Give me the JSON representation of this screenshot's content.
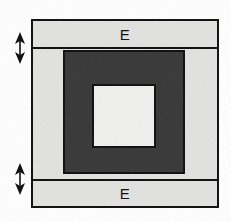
{
  "diagram": {
    "canvas": {
      "width": 231,
      "height": 222,
      "background": "#ffffff"
    },
    "colors": {
      "light_gray": "#e2e2e0",
      "dark_gray": "#3a3a3a",
      "cavity_white": "#f0f0ee",
      "outline": "#111111"
    },
    "layers": {
      "top_band": {
        "label": "E",
        "fill": "#e2e2e0",
        "x": 31,
        "y": 19,
        "width": 188,
        "height": 30
      },
      "bottom_band": {
        "label": "E",
        "fill": "#e2e2e0",
        "x": 31,
        "y": 179,
        "width": 188,
        "height": 29
      },
      "outer_frame": {
        "fill": "#e2e2e0",
        "x": 31,
        "y": 19,
        "width": 188,
        "height": 189
      },
      "core_block": {
        "fill": "#3a3a3a",
        "x": 63,
        "y": 50,
        "width": 122,
        "height": 124
      },
      "inner_cavity": {
        "fill": "#f0f0ee",
        "x": 92,
        "y": 84,
        "width": 64,
        "height": 64
      }
    },
    "markers": [
      {
        "name": "upper-dimension-arrow",
        "type": "double-headed-arrow",
        "x": 12,
        "y": 31
      },
      {
        "name": "lower-dimension-arrow",
        "type": "double-headed-arrow",
        "x": 12,
        "y": 162
      }
    ]
  }
}
